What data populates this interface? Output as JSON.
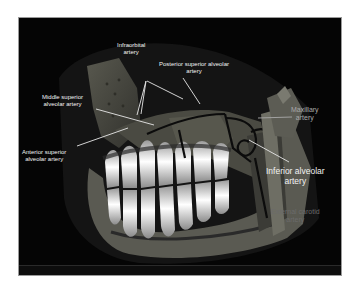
{
  "figure": {
    "background": "#050505",
    "border_color": "#9a9a9a",
    "labels": [
      {
        "id": "infraorbital",
        "lines": [
          "Infraorbital",
          "artery"
        ]
      },
      {
        "id": "posterior_superior_alveolar",
        "lines": [
          "Posterior superior alveolar",
          "artery"
        ]
      },
      {
        "id": "middle_superior_alveolar",
        "lines": [
          "Middle superior",
          "alveolar artery"
        ]
      },
      {
        "id": "anterior_superior_alveolar",
        "lines": [
          "Anterior superior",
          "alveolar artery"
        ]
      },
      {
        "id": "maxillary",
        "lines": [
          "Maxillary",
          "artery"
        ]
      },
      {
        "id": "inferior_alveolar",
        "lines": [
          "Inferior alveolar",
          "artery"
        ]
      },
      {
        "id": "external_carotid",
        "lines": [
          "External carotid",
          "artery"
        ]
      }
    ],
    "colors": {
      "label_white": "#f2f2f2",
      "label_gray": "#a9a9a9",
      "label_dim": "#6b6b6b",
      "leader_line": "#e8e8e8",
      "tooth": "#f4f4f4",
      "bone": "#8a8a7a"
    }
  }
}
